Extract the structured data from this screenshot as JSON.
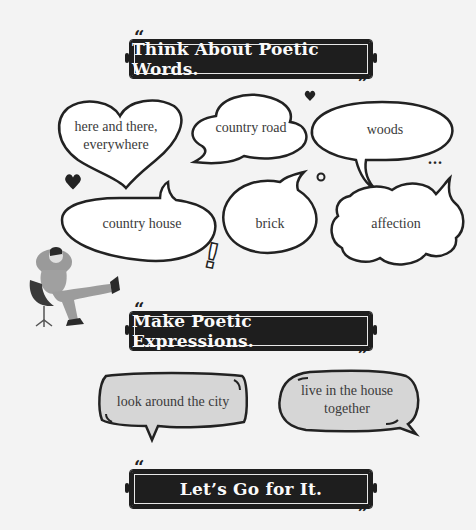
{
  "sections": {
    "words_title": "Think About Poetic Words.",
    "expressions_title": "Make Poetic Expressions.",
    "go_title": "Let’s Go for It."
  },
  "words": [
    {
      "label": "here and there, everywhere",
      "line1": "here and there,",
      "line2": "everywhere",
      "shape": "heart"
    },
    {
      "label": "country road",
      "shape": "cloud"
    },
    {
      "label": "woods",
      "shape": "oval"
    },
    {
      "label": "country house",
      "shape": "oval"
    },
    {
      "label": "brick",
      "shape": "oval"
    },
    {
      "label": "affection",
      "shape": "cloud"
    }
  ],
  "expressions": [
    {
      "label": "look around the city"
    },
    {
      "line1": "live in the house",
      "line2": "together",
      "label": "live in the house together"
    }
  ],
  "decorations": {
    "ellipsis": "...",
    "exclamation": "!"
  },
  "colors": {
    "banner_bg": "#1e1e1e",
    "banner_text": "#fafafa",
    "page_bg": "#f3f3f3",
    "expression_fill": "#d6d6d6"
  }
}
